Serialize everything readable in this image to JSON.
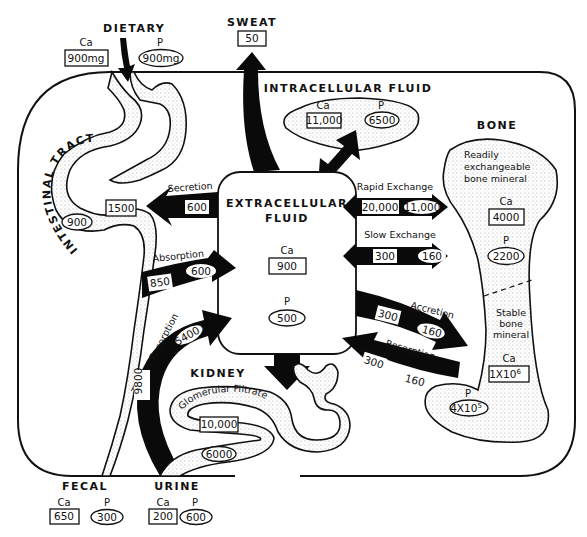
{
  "units_note": "mg",
  "compartments": {
    "dietary": {
      "label": "DIETARY",
      "ca_label": "Ca",
      "ca": "900mg",
      "p_label": "P",
      "p": "900mg"
    },
    "sweat": {
      "label": "SWEAT",
      "ca": "50"
    },
    "intracellular": {
      "label": "INTRACELLULAR FLUID",
      "ca_label": "Ca",
      "ca": "11,000",
      "p_label": "P",
      "p": "6500"
    },
    "extracellular": {
      "label_line1": "EXTRACELLULAR",
      "label_line2": "FLUID",
      "ca_label": "Ca",
      "ca": "900",
      "p_label": "P",
      "p": "500"
    },
    "intestinal": {
      "label": "INTESTINAL TRACT",
      "ca": "1500",
      "p": "900"
    },
    "bone": {
      "label": "BONE",
      "readily_line1": "Readily",
      "readily_line2": "exchangeable",
      "readily_line3": "bone mineral",
      "readily_ca_label": "Ca",
      "readily_ca": "4000",
      "readily_p_label": "P",
      "readily_p": "2200",
      "stable_line1": "Stable",
      "stable_line2": "bone",
      "stable_line3": "mineral",
      "stable_ca_label": "Ca",
      "stable_ca": "1X10",
      "stable_ca_exp": "6",
      "stable_p_label": "P",
      "stable_p": "4X10",
      "stable_p_exp": "5"
    },
    "kidney": {
      "label": "KIDNEY",
      "filtrate_label": "Glomerular Filtrate",
      "filtrate_ca": "10,000",
      "filtrate_p": "6000"
    },
    "fecal": {
      "label": "FECAL",
      "ca_label": "Ca",
      "ca": "650",
      "p_label": "P",
      "p": "300"
    },
    "urine": {
      "label": "URINE",
      "ca_label": "Ca",
      "ca": "200",
      "p_label": "P",
      "p": "600"
    }
  },
  "flows": {
    "secretion": {
      "label": "Secretion",
      "ca": "600"
    },
    "absorption": {
      "label": "Absorption",
      "ca": "850",
      "p": "600"
    },
    "rapid_exchange": {
      "label": "Rapid Exchange",
      "ca": "20,000",
      "p": "11,000"
    },
    "slow_exchange": {
      "label": "Slow Exchange",
      "ca": "300",
      "p": "160"
    },
    "accretion": {
      "label": "Accretion",
      "ca": "300",
      "p": "160"
    },
    "resorption": {
      "label": "Resorption",
      "ca": "300",
      "p": "160"
    },
    "tubular_resorption": {
      "label": "Tubular Resorption",
      "ca": "9800",
      "p": "5400"
    }
  },
  "legend_convention": {
    "ca_shape": "rectangle",
    "p_shape": "ellipse"
  }
}
